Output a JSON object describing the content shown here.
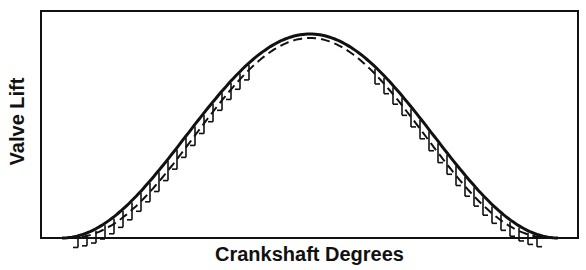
{
  "chart_data": {
    "type": "line",
    "title": "",
    "xlabel": "Crankshaft Degrees",
    "ylabel": "Valve Lift",
    "grid": false,
    "legend": null,
    "x_ticks": [],
    "y_ticks": [],
    "series": [
      {
        "name": "Solid profile",
        "style": "solid",
        "x_norm": [
          0,
          0.1,
          0.2,
          0.3,
          0.4,
          0.5,
          0.6,
          0.7,
          0.8,
          0.9,
          1.0
        ],
        "y_norm": [
          0,
          0.1,
          0.35,
          0.65,
          0.9,
          1.0,
          0.9,
          0.65,
          0.35,
          0.1,
          0
        ]
      },
      {
        "name": "Dashed profile",
        "style": "dashed",
        "x_norm": [
          0,
          0.1,
          0.2,
          0.3,
          0.4,
          0.5,
          0.6,
          0.7,
          0.8,
          0.9,
          1.0
        ],
        "y_norm": [
          0,
          0.06,
          0.28,
          0.58,
          0.86,
          0.98,
          0.86,
          0.58,
          0.28,
          0.06,
          0
        ]
      }
    ],
    "annotations": [
      "hatched region between solid and dashed curves"
    ]
  },
  "labels": {
    "x_axis": "Crankshaft Degrees",
    "y_axis": "Valve Lift"
  }
}
